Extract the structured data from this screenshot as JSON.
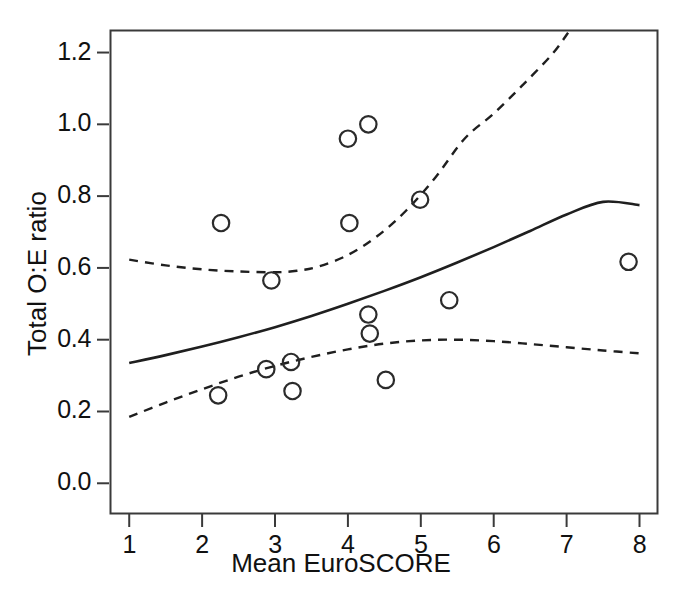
{
  "chart_data": {
    "type": "scatter",
    "title": "",
    "xlabel": "Mean EuroSCORE",
    "ylabel": "Total O:E ratio",
    "xlim": [
      0.75,
      8.24
    ],
    "ylim": [
      -0.08,
      1.26
    ],
    "xticks": [
      "1",
      "2",
      "3",
      "4",
      "5",
      "6",
      "7",
      "8"
    ],
    "xtick_values": [
      1,
      2,
      3,
      4,
      5,
      6,
      7,
      8
    ],
    "yticks": [
      "0.0",
      "0.2",
      "0.4",
      "0.6",
      "0.8",
      "1.0",
      "1.2"
    ],
    "ytick_values": [
      0.0,
      0.2,
      0.4,
      0.6,
      0.8,
      1.0,
      1.2
    ],
    "grid": false,
    "legend": "none",
    "marker": "open-circle",
    "points": [
      {
        "x": 2.26,
        "y": 0.725
      },
      {
        "x": 2.22,
        "y": 0.245
      },
      {
        "x": 2.95,
        "y": 0.565
      },
      {
        "x": 2.88,
        "y": 0.318
      },
      {
        "x": 3.22,
        "y": 0.338
      },
      {
        "x": 3.24,
        "y": 0.257
      },
      {
        "x": 4.0,
        "y": 0.96
      },
      {
        "x": 4.28,
        "y": 1.0
      },
      {
        "x": 4.02,
        "y": 0.725
      },
      {
        "x": 4.28,
        "y": 0.47
      },
      {
        "x": 4.3,
        "y": 0.417
      },
      {
        "x": 4.52,
        "y": 0.288
      },
      {
        "x": 4.99,
        "y": 0.79
      },
      {
        "x": 5.39,
        "y": 0.51
      },
      {
        "x": 7.85,
        "y": 0.617
      }
    ],
    "series": [
      {
        "name": "fitted-regression-line",
        "style": "solid",
        "points": [
          {
            "x": 1.0,
            "y": 0.335
          },
          {
            "x": 1.5,
            "y": 0.357
          },
          {
            "x": 2.0,
            "y": 0.381
          },
          {
            "x": 2.5,
            "y": 0.407
          },
          {
            "x": 3.0,
            "y": 0.435
          },
          {
            "x": 3.5,
            "y": 0.466
          },
          {
            "x": 4.0,
            "y": 0.5
          },
          {
            "x": 4.5,
            "y": 0.536
          },
          {
            "x": 5.0,
            "y": 0.574
          },
          {
            "x": 5.5,
            "y": 0.615
          },
          {
            "x": 6.0,
            "y": 0.658
          },
          {
            "x": 6.5,
            "y": 0.703
          },
          {
            "x": 7.0,
            "y": 0.749
          },
          {
            "x": 7.5,
            "y": 0.784
          },
          {
            "x": 8.0,
            "y": 0.775
          }
        ]
      },
      {
        "name": "upper-confidence-bound",
        "style": "dashed",
        "points": [
          {
            "x": 1.0,
            "y": 0.623
          },
          {
            "x": 1.5,
            "y": 0.607
          },
          {
            "x": 2.0,
            "y": 0.596
          },
          {
            "x": 2.5,
            "y": 0.59
          },
          {
            "x": 3.0,
            "y": 0.588
          },
          {
            "x": 3.3,
            "y": 0.592
          },
          {
            "x": 3.6,
            "y": 0.604
          },
          {
            "x": 4.0,
            "y": 0.636
          },
          {
            "x": 4.4,
            "y": 0.688
          },
          {
            "x": 4.8,
            "y": 0.76
          },
          {
            "x": 5.2,
            "y": 0.852
          },
          {
            "x": 5.6,
            "y": 0.96
          },
          {
            "x": 6.0,
            "y": 1.03
          },
          {
            "x": 6.4,
            "y": 1.11
          },
          {
            "x": 6.8,
            "y": 1.195
          },
          {
            "x": 7.02,
            "y": 1.255
          }
        ]
      },
      {
        "name": "lower-confidence-bound",
        "style": "dashed",
        "points": [
          {
            "x": 1.0,
            "y": 0.185
          },
          {
            "x": 1.5,
            "y": 0.225
          },
          {
            "x": 2.0,
            "y": 0.262
          },
          {
            "x": 2.5,
            "y": 0.297
          },
          {
            "x": 3.0,
            "y": 0.327
          },
          {
            "x": 3.5,
            "y": 0.352
          },
          {
            "x": 4.0,
            "y": 0.373
          },
          {
            "x": 4.5,
            "y": 0.389
          },
          {
            "x": 5.0,
            "y": 0.398
          },
          {
            "x": 5.5,
            "y": 0.4
          },
          {
            "x": 6.0,
            "y": 0.396
          },
          {
            "x": 6.5,
            "y": 0.388
          },
          {
            "x": 7.0,
            "y": 0.379
          },
          {
            "x": 7.5,
            "y": 0.37
          },
          {
            "x": 8.0,
            "y": 0.362
          }
        ]
      }
    ]
  },
  "figure": {
    "frame_color": "#3a3a3a",
    "marker_color": "#2b2b2b",
    "line_color": "#1f1f1f",
    "background": "#ffffff"
  }
}
